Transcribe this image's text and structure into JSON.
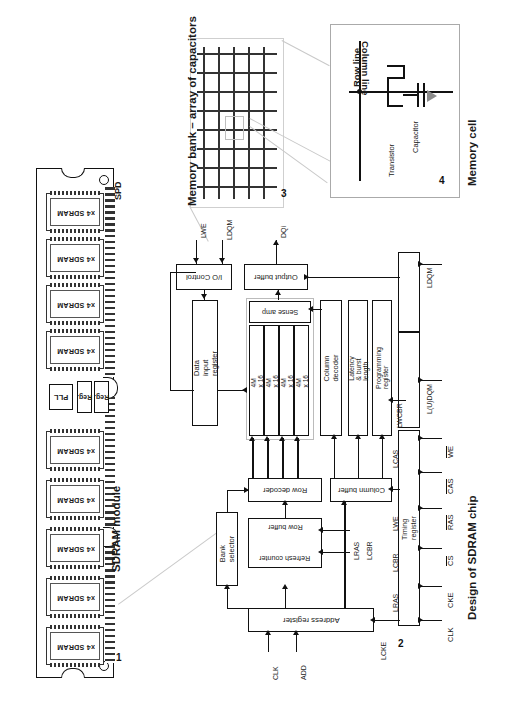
{
  "figure": {
    "orientation": "rotated-90",
    "panels": [
      {
        "number": "1",
        "title": "SDRAM module"
      },
      {
        "number": "2",
        "title": "Design of SDRAM chip"
      },
      {
        "number": "3",
        "title": "Memory bank – array of capacitors"
      },
      {
        "number": "4",
        "title": "Memory cell"
      }
    ]
  },
  "module": {
    "number": "1",
    "title": "SDRAM module",
    "chip_label": "x4 SDRAM",
    "chip_count": 9,
    "spd_label": "SPD",
    "pll_label": "PLL",
    "reg_label": "Reg.",
    "reg_count": 2
  },
  "memory_bank": {
    "number": "3",
    "title": "Memory bank – array of capacitors",
    "grid_rows": 8,
    "grid_cols": 6
  },
  "memory_cell": {
    "number": "4",
    "title": "Memory cell",
    "row_line": "Row line",
    "column_line": "Column line",
    "transistor": "Transistor",
    "capacitor": "Capacitor"
  },
  "chip": {
    "number": "2",
    "title": "Design of SDRAM chip",
    "blocks": {
      "io_control": "I/O Control",
      "output_buffer": "Output buffer",
      "data_input_register": "Data input register",
      "sense_amp": "Sense amp",
      "column_decoder": "Column decoder",
      "latency_burst": "Latency & burst length",
      "programming_register": "Programming register",
      "row_decoder": "Row decoder",
      "bank_selector": "Bank selector",
      "refresh_counter": "Refresh counter",
      "row_buffer": "Row buffer",
      "column_buffer": "Column buffer",
      "timing_register": "Timing register",
      "address_register": "Address register"
    },
    "banks": [
      "4M x 16",
      "4M x 16",
      "4M x 16",
      "4M x 16"
    ],
    "internal_signals": {
      "lwe": "LWE",
      "ldqm_io": "LDQM",
      "dqi": "DQi",
      "lcas": "LCAS",
      "lwe2": "LWE",
      "lcbr": "LCBR",
      "lras": "LRAS",
      "lcke": "LCKE",
      "lwcbr": "LWCBR",
      "ldqm_right": "LDQM",
      "ludqm": "L(U)DQM",
      "lras_rowbuf": "LRAS",
      "lcbr_rowbuf": "LCBR"
    },
    "address_inputs": [
      "CLK",
      "ADD"
    ],
    "external_pins": [
      {
        "name": "CLK",
        "overbar": false
      },
      {
        "name": "CKE",
        "overbar": false
      },
      {
        "name": "CS",
        "overbar": true
      },
      {
        "name": "RAS",
        "overbar": true
      },
      {
        "name": "CAS",
        "overbar": true
      },
      {
        "name": "WE",
        "overbar": true
      }
    ]
  },
  "colors": {
    "ink": "#111111",
    "grid": "#333333",
    "leader": "#c9c9c9",
    "paper": "#ffffff"
  }
}
